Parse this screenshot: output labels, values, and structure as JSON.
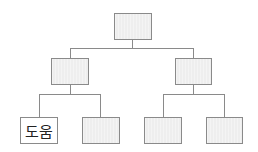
{
  "diagram": {
    "type": "tree",
    "title": "",
    "colors": {
      "node_fill": "#eeeeee",
      "node_border": "#8a8a8a",
      "line": "#8a8a8a",
      "label_fill": "#ffffff"
    },
    "root": {
      "label": ""
    },
    "level1": [
      {
        "label": ""
      },
      {
        "label": ""
      }
    ],
    "leaves": [
      {
        "label": "도움"
      },
      {
        "label": ""
      },
      {
        "label": ""
      },
      {
        "label": ""
      }
    ]
  }
}
